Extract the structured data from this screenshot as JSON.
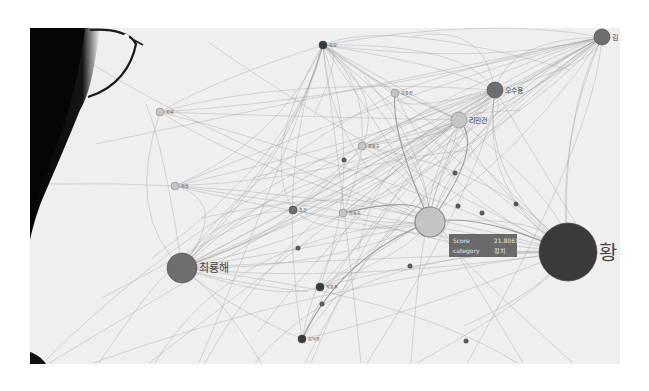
{
  "scene": {
    "description": "Photo of a person wearing glasses viewing a network graph visualization on a screen"
  },
  "graph": {
    "nodes": [
      {
        "id": "hwang",
        "label": "황",
        "size": "xl",
        "tone": "dark"
      },
      {
        "id": "choi",
        "label": "최룡해",
        "size": "l",
        "tone": "mid"
      },
      {
        "id": "center",
        "label": "",
        "size": "l",
        "tone": "light"
      },
      {
        "id": "oh",
        "label": "오수용",
        "size": "m",
        "tone": "mid"
      },
      {
        "id": "ri",
        "label": "리만건",
        "size": "m",
        "tone": "light"
      },
      {
        "id": "kim_tr",
        "label": "김",
        "size": "m",
        "tone": "mid"
      },
      {
        "id": "top",
        "label": "김원",
        "size": "s",
        "tone": "dark"
      },
      {
        "id": "n1",
        "label": "리충진",
        "size": "s",
        "tone": "light"
      },
      {
        "id": "n2",
        "label": "김용호",
        "size": "s",
        "tone": "light"
      },
      {
        "id": "n3",
        "label": "조건",
        "size": "s",
        "tone": "mid"
      },
      {
        "id": "n4",
        "label": "리용호",
        "size": "s",
        "tone": "light"
      },
      {
        "id": "n5",
        "label": "최휘",
        "size": "s",
        "tone": "light"
      },
      {
        "id": "n6",
        "label": "리철",
        "size": "s",
        "tone": "light"
      },
      {
        "id": "n7",
        "label": "김덕훈",
        "size": "s",
        "tone": "dark"
      },
      {
        "id": "n8",
        "label": "박봉주",
        "size": "s",
        "tone": "dark"
      }
    ],
    "tooltip": {
      "rows": [
        {
          "key": "Score",
          "value": "21.8061"
        },
        {
          "key": "category",
          "value": "정치"
        }
      ]
    },
    "colors": {
      "dark": "#3a3a3a",
      "mid": "#6e6e6e",
      "light": "#c4c4c4",
      "tooltip_bg": "#6a6a6a"
    }
  }
}
